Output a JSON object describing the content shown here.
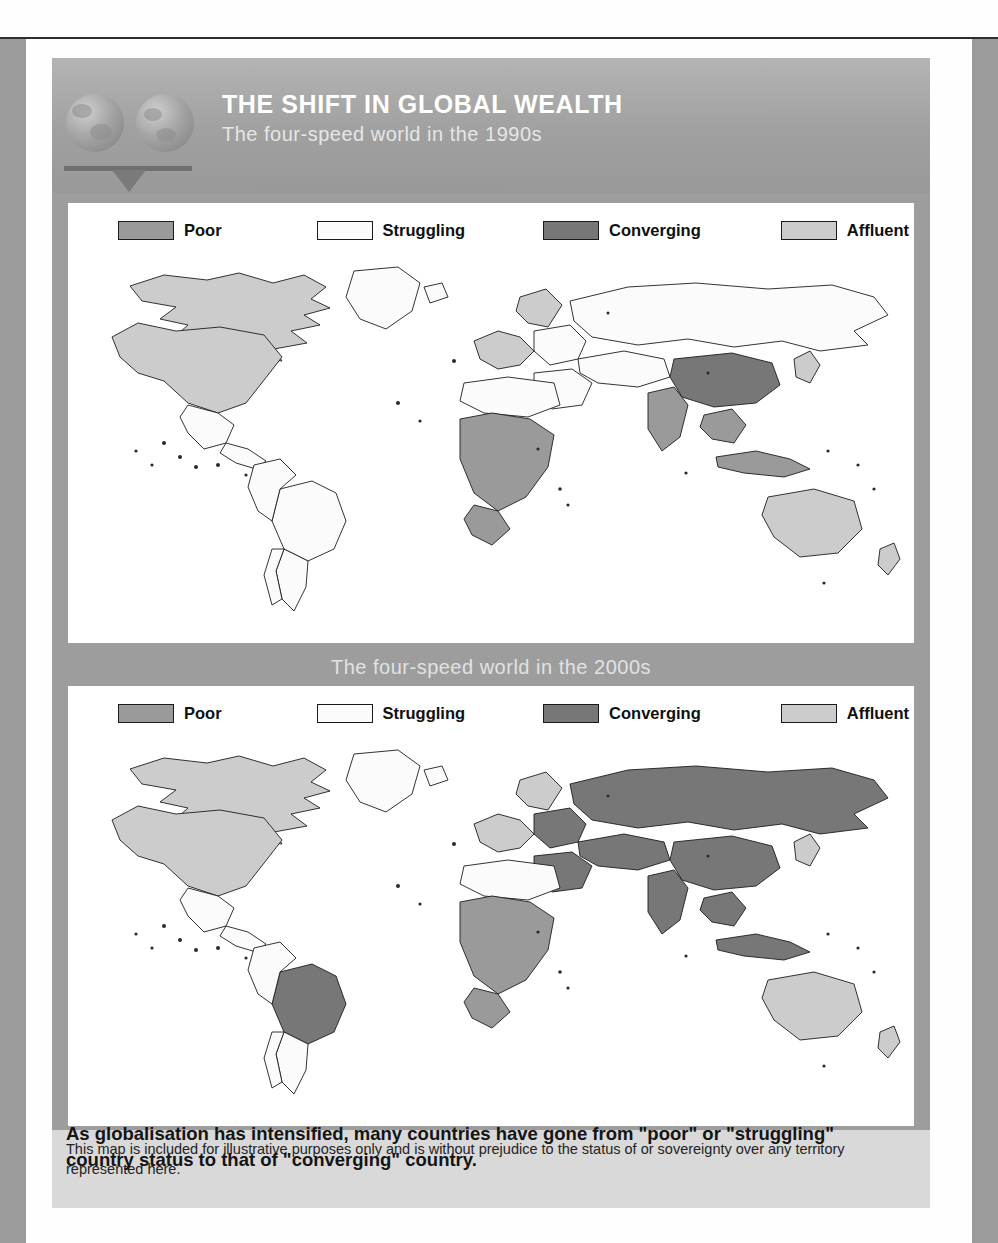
{
  "header": {
    "title": "THE SHIFT IN GLOBAL WEALTH",
    "subtitle": "The four-speed world in the 1990s",
    "logo_icon": "balance-scale-globes-icon"
  },
  "map_sections": [
    {
      "id": "map-1990s",
      "subtitle": "The four-speed world in the 1990s",
      "legend": [
        {
          "label": "Poor",
          "color": "#9a9a9a"
        },
        {
          "label": "Struggling",
          "color": "#fbfbfb"
        },
        {
          "label": "Converging",
          "color": "#777777"
        },
        {
          "label": "Affluent",
          "color": "#cccccc"
        }
      ]
    },
    {
      "id": "map-2000s",
      "subtitle": "The four-speed world in the 2000s",
      "legend": [
        {
          "label": "Poor",
          "color": "#9a9a9a"
        },
        {
          "label": "Struggling",
          "color": "#fbfbfb"
        },
        {
          "label": "Converging",
          "color": "#777777"
        },
        {
          "label": "Affluent",
          "color": "#cccccc"
        }
      ]
    }
  ],
  "footnote": "This map is included for illustrative purposes only and is without prejudice to the status of or sovereignty over any territory represented here.",
  "caption": "As globalisation has intensified, many countries have gone from \"poor\" or \"struggling\" country status to that of \"converging\" country.",
  "chart_data": {
    "type": "map",
    "title": "THE SHIFT IN GLOBAL WEALTH",
    "projection": "world-choropleth",
    "categories": [
      "Poor",
      "Struggling",
      "Converging",
      "Affluent"
    ],
    "category_colors": {
      "Poor": "#9a9a9a",
      "Struggling": "#fbfbfb",
      "Converging": "#777777",
      "Affluent": "#cccccc"
    },
    "legend_position": "top",
    "panels": [
      {
        "name": "The four-speed world in the 1990s",
        "period": "1990s",
        "regions": {
          "United States": "Affluent",
          "Canada": "Affluent",
          "Greenland": "Struggling",
          "Mexico": "Struggling",
          "Central America": "Struggling",
          "Brazil": "Struggling",
          "Argentina": "Struggling",
          "Chile": "Struggling",
          "South America (rest)": "Struggling",
          "Western Europe": "Affluent",
          "Scandinavia": "Affluent",
          "Eastern Europe": "Struggling",
          "Russia": "Struggling",
          "Central Asia": "Struggling",
          "North Africa": "Struggling",
          "Sub-Saharan Africa": "Poor",
          "South Africa": "Poor",
          "Middle East": "Struggling",
          "India": "Poor",
          "China": "Converging",
          "Japan": "Affluent",
          "South East Asia": "Poor",
          "Indonesia": "Poor",
          "Australia": "Affluent",
          "New Zealand": "Affluent"
        }
      },
      {
        "name": "The four-speed world in the 2000s",
        "period": "2000s",
        "regions": {
          "United States": "Affluent",
          "Canada": "Affluent",
          "Greenland": "Struggling",
          "Mexico": "Struggling",
          "Central America": "Struggling",
          "Brazil": "Converging",
          "Argentina": "Struggling",
          "Chile": "Struggling",
          "South America (rest)": "Struggling",
          "Western Europe": "Affluent",
          "Scandinavia": "Affluent",
          "Eastern Europe": "Converging",
          "Russia": "Converging",
          "Central Asia": "Converging",
          "North Africa": "Struggling",
          "Sub-Saharan Africa": "Poor",
          "South Africa": "Poor",
          "Middle East": "Converging",
          "India": "Converging",
          "China": "Converging",
          "Japan": "Affluent",
          "South East Asia": "Converging",
          "Indonesia": "Converging",
          "Australia": "Affluent",
          "New Zealand": "Affluent"
        }
      }
    ]
  }
}
